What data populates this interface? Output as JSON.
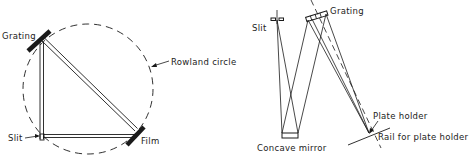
{
  "colors": {
    "ink": "#1a1a1a",
    "background": "#ffffff"
  },
  "left_diagram": {
    "labels": {
      "grating": "Grating",
      "rowland_circle": "Rowland circle",
      "slit": "Slit",
      "film": "Film"
    }
  },
  "right_diagram": {
    "labels": {
      "slit": "Slit",
      "grating": "Grating",
      "concave_mirror": "Concave mirror",
      "plate_holder": "Plate holder",
      "rail": "Rail for plate holder"
    }
  }
}
